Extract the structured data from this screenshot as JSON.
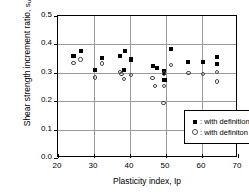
{
  "chart_data": {
    "type": "scatter",
    "title": "",
    "xlabel": "Plasticity index, Ip",
    "ylabel_line1": "Shear strength increment ratio,",
    "ylabel_line2": "su(u,b)/s'vB",
    "xlim": [
      20,
      70
    ],
    "ylim": [
      0.0,
      0.5
    ],
    "xticks": [
      "20",
      "30",
      "40",
      "50",
      "60",
      "70"
    ],
    "xtick_values": [
      20,
      30,
      40,
      50,
      60,
      70
    ],
    "yticks": [
      "0.0",
      "0.1",
      "0.2",
      "0.3",
      "0.4",
      "0.5"
    ],
    "ytick_values": [
      0.0,
      0.1,
      0.2,
      0.3,
      0.4,
      0.5
    ],
    "grid": true,
    "legend_position": "lower-right-inside",
    "series": [
      {
        "name": "with definition A",
        "marker": "filled-square",
        "color": "#000000",
        "points": [
          [
            24.3,
            0.358
          ],
          [
            26.3,
            0.378
          ],
          [
            30.3,
            0.309
          ],
          [
            32.3,
            0.352
          ],
          [
            37.3,
            0.358
          ],
          [
            38.6,
            0.377
          ],
          [
            38.3,
            0.31
          ],
          [
            40.2,
            0.347
          ],
          [
            46.3,
            0.324
          ],
          [
            47.6,
            0.318
          ],
          [
            49.4,
            0.305
          ],
          [
            49.4,
            0.299
          ],
          [
            49.6,
            0.276
          ],
          [
            51.4,
            0.385
          ],
          [
            56.2,
            0.338
          ],
          [
            60.2,
            0.339
          ],
          [
            64.2,
            0.356
          ],
          [
            64.2,
            0.331
          ]
        ]
      },
      {
        "name": "with definiton B",
        "marker": "open-circle",
        "color": "#4a4a4a",
        "points": [
          [
            24.3,
            0.334
          ],
          [
            26.3,
            0.347
          ],
          [
            30.3,
            0.283
          ],
          [
            32.3,
            0.333
          ],
          [
            37.3,
            0.303
          ],
          [
            37.6,
            0.296
          ],
          [
            38.3,
            0.279
          ],
          [
            40.2,
            0.293
          ],
          [
            46.3,
            0.281
          ],
          [
            47.0,
            0.254
          ],
          [
            49.4,
            0.297
          ],
          [
            49.4,
            0.254
          ],
          [
            49.3,
            0.193
          ],
          [
            51.4,
            0.327
          ],
          [
            56.2,
            0.3
          ],
          [
            60.2,
            0.296
          ],
          [
            64.2,
            0.303
          ],
          [
            64.2,
            0.27
          ]
        ]
      }
    ]
  },
  "legend": {
    "entries": [
      {
        "symbol": "filled-square",
        "separator": ":",
        "label": "with definition A"
      },
      {
        "symbol": "open-circle",
        "separator": ":",
        "label": "with definiton B"
      }
    ]
  }
}
